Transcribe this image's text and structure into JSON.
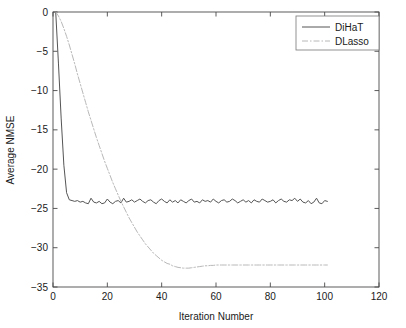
{
  "chart_data": {
    "type": "line",
    "title": "",
    "xlabel": "Iteration Number",
    "ylabel": "Average NMSE",
    "xlim": [
      0,
      120
    ],
    "ylim": [
      -35,
      0
    ],
    "xticks": [
      0,
      20,
      40,
      60,
      80,
      100,
      120
    ],
    "yticks": [
      0,
      -5,
      -10,
      -15,
      -20,
      -25,
      -30,
      -35
    ],
    "xtick_labels": [
      "0",
      "20",
      "40",
      "60",
      "80",
      "100",
      "120"
    ],
    "ytick_labels": [
      "0",
      "−5",
      "−10",
      "−15",
      "−20",
      "−25",
      "−30",
      "−35"
    ],
    "grid": false,
    "legend_position": "upper right",
    "series": [
      {
        "name": "DiHaT",
        "style": "solid",
        "color": "#555555",
        "x": [
          1,
          2,
          3,
          4,
          5,
          6,
          7,
          8,
          9,
          10,
          11,
          12,
          13,
          14,
          15,
          16,
          17,
          18,
          19,
          20,
          21,
          22,
          23,
          24,
          25,
          26,
          27,
          28,
          29,
          30,
          31,
          32,
          33,
          34,
          35,
          36,
          37,
          38,
          39,
          40,
          41,
          42,
          43,
          44,
          45,
          46,
          47,
          48,
          49,
          50,
          51,
          52,
          53,
          54,
          55,
          56,
          57,
          58,
          59,
          60,
          61,
          62,
          63,
          64,
          65,
          66,
          67,
          68,
          69,
          70,
          71,
          72,
          73,
          74,
          75,
          76,
          77,
          78,
          79,
          80,
          81,
          82,
          83,
          84,
          85,
          86,
          87,
          88,
          89,
          90,
          91,
          92,
          93,
          94,
          95,
          96,
          97,
          98,
          99,
          100,
          101
        ],
        "values": [
          0,
          -6.5,
          -13.5,
          -19.5,
          -23.0,
          -23.9,
          -24.0,
          -24.1,
          -24.0,
          -24.2,
          -24.1,
          -24.3,
          -24.4,
          -23.7,
          -24.2,
          -24.3,
          -24.1,
          -24.4,
          -24.3,
          -23.8,
          -24.2,
          -24.4,
          -24.1,
          -24.0,
          -24.3,
          -23.7,
          -24.2,
          -24.1,
          -23.9,
          -24.2,
          -24.0,
          -23.8,
          -24.1,
          -24.3,
          -24.0,
          -23.9,
          -24.2,
          -24.4,
          -24.0,
          -23.8,
          -24.1,
          -24.3,
          -23.9,
          -24.2,
          -24.0,
          -24.3,
          -23.9,
          -24.1,
          -24.3,
          -24.0,
          -23.8,
          -24.2,
          -24.1,
          -24.3,
          -23.9,
          -24.1,
          -24.0,
          -24.2,
          -23.8,
          -24.1,
          -24.3,
          -24.0,
          -23.9,
          -24.2,
          -24.1,
          -23.8,
          -24.0,
          -24.3,
          -24.1,
          -23.9,
          -24.2,
          -24.0,
          -24.3,
          -23.9,
          -24.1,
          -24.2,
          -23.8,
          -24.0,
          -24.2,
          -24.1,
          -23.9,
          -24.3,
          -24.0,
          -23.8,
          -24.1,
          -24.2,
          -23.9,
          -24.0,
          -23.7,
          -24.1,
          -23.8,
          -24.2,
          -24.3,
          -24.0,
          -24.4,
          -24.2,
          -23.7,
          -24.3,
          -24.4,
          -24.0,
          -24.1
        ]
      },
      {
        "name": "DLasso",
        "style": "dash-dot",
        "color": "#b8b8b8",
        "x": [
          1,
          2,
          3,
          4,
          5,
          6,
          7,
          8,
          9,
          10,
          11,
          12,
          13,
          14,
          15,
          16,
          17,
          18,
          19,
          20,
          21,
          22,
          23,
          24,
          25,
          26,
          27,
          28,
          29,
          30,
          31,
          32,
          33,
          34,
          35,
          36,
          37,
          38,
          39,
          40,
          41,
          42,
          43,
          44,
          45,
          46,
          47,
          48,
          49,
          50,
          51,
          52,
          53,
          54,
          55,
          56,
          57,
          58,
          59,
          60,
          61,
          62,
          63,
          64,
          65,
          66,
          67,
          68,
          69,
          70,
          71,
          72,
          73,
          74,
          75,
          76,
          77,
          78,
          79,
          80,
          81,
          82,
          83,
          84,
          85,
          86,
          87,
          88,
          89,
          90,
          91,
          92,
          93,
          94,
          95,
          96,
          97,
          98,
          99,
          100,
          101
        ],
        "values": [
          0,
          -0.5,
          -1.2,
          -2.1,
          -3.1,
          -4.2,
          -5.4,
          -6.6,
          -7.9,
          -9.1,
          -10.3,
          -11.5,
          -12.7,
          -13.8,
          -14.9,
          -16.0,
          -17.0,
          -18.0,
          -19.0,
          -19.9,
          -20.8,
          -21.7,
          -22.5,
          -23.3,
          -24.1,
          -24.8,
          -25.5,
          -26.2,
          -26.8,
          -27.4,
          -28.0,
          -28.5,
          -29.0,
          -29.5,
          -29.9,
          -30.3,
          -30.7,
          -31.0,
          -31.3,
          -31.6,
          -31.8,
          -32.0,
          -32.1,
          -32.3,
          -32.4,
          -32.5,
          -32.55,
          -32.6,
          -32.6,
          -32.6,
          -32.55,
          -32.5,
          -32.45,
          -32.4,
          -32.35,
          -32.3,
          -32.3,
          -32.25,
          -32.25,
          -32.2,
          -32.2,
          -32.2,
          -32.2,
          -32.2,
          -32.2,
          -32.2,
          -32.2,
          -32.2,
          -32.2,
          -32.2,
          -32.2,
          -32.2,
          -32.2,
          -32.2,
          -32.2,
          -32.2,
          -32.2,
          -32.2,
          -32.2,
          -32.2,
          -32.2,
          -32.2,
          -32.2,
          -32.2,
          -32.2,
          -32.2,
          -32.2,
          -32.2,
          -32.2,
          -32.2,
          -32.2,
          -32.2,
          -32.2,
          -32.2,
          -32.2,
          -32.2,
          -32.2,
          -32.2,
          -32.2,
          -32.2,
          -32.2
        ]
      }
    ]
  },
  "legend": {
    "entries": [
      {
        "label": "DiHaT"
      },
      {
        "label": "DLasso"
      }
    ]
  },
  "colors": {
    "axis": "#4a4a4a",
    "dihat": "#555555",
    "dlasso": "#b8b8b8",
    "background": "#ffffff"
  }
}
